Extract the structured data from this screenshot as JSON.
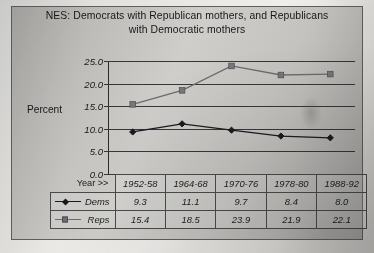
{
  "chart_data": {
    "type": "line",
    "title": "NES: Democrats with Republican mothers, and Republicans with Democratic mothers",
    "title_line1": "NES: Democrats with Republican mothers, and Republicans",
    "title_line2": "with Democratic mothers",
    "xlabel": "Year >>",
    "ylabel": "Percent",
    "categories": [
      "1952-58",
      "1964-68",
      "1970-76",
      "1978-80",
      "1988-92"
    ],
    "series": [
      {
        "name": "Dems",
        "values": [
          9.3,
          11.1,
          9.7,
          8.4,
          8.0
        ],
        "color": "#1b1b1e",
        "marker": "diamond"
      },
      {
        "name": "Reps",
        "values": [
          15.4,
          18.5,
          23.9,
          21.9,
          22.1
        ],
        "color": "#6c6c6f",
        "marker": "square"
      }
    ],
    "ylim": [
      0.0,
      25.0
    ],
    "ytick_labels": [
      "25.0",
      "20.0",
      "15.0",
      "10.0",
      "5.0",
      "0.0"
    ],
    "ytick_values": [
      25.0,
      20.0,
      15.0,
      10.0,
      5.0,
      0.0
    ],
    "grid": true,
    "legend_position": "data-table"
  },
  "table": {
    "year_header_label": "Year >>",
    "columns": [
      "1952-58",
      "1964-68",
      "1970-76",
      "1978-80",
      "1988-92"
    ],
    "rows": [
      {
        "label": "Dems",
        "marker": "diamond-icon",
        "values": [
          "9.3",
          "11.1",
          "9.7",
          "8.4",
          "8.0"
        ]
      },
      {
        "label": "Reps",
        "marker": "square-icon",
        "values": [
          "15.4",
          "18.5",
          "23.9",
          "21.9",
          "22.1"
        ]
      }
    ]
  }
}
